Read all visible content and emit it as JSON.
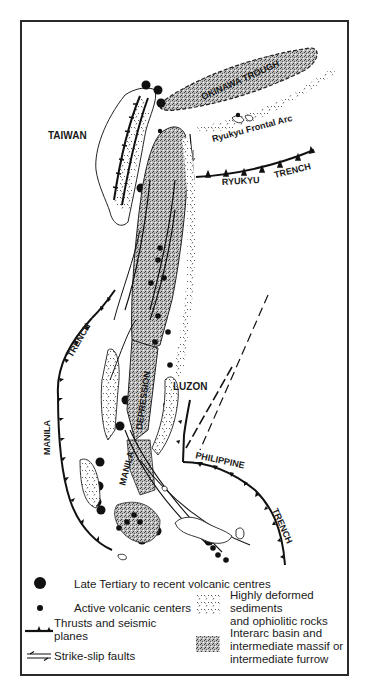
{
  "map": {
    "labels": {
      "okinawa_trough": "OKINAWA TROUGH",
      "ryukyu_frontal_arc": "Ryukyu Frontal Arc",
      "taiwan": "TAIWAN",
      "ryukyu": "RYUKYU",
      "ryukyu_trench": "TRENCH",
      "luzon": "LUZON",
      "depression": "DEPRESSION",
      "manila_basin": "MANILA",
      "manila": "MANILA",
      "manila_trench": "TRENCH",
      "philippine": "PHILIPPINE",
      "philippine_trench": "TRENCH"
    }
  },
  "legend": {
    "items": [
      {
        "symbol": "large-dot",
        "label": "Late Tertiary to recent volcanic centres"
      },
      {
        "symbol": "small-dot",
        "label": "Active volcanic centers"
      },
      {
        "symbol": "thrust-line",
        "label": "Thrusts and seismic planes"
      },
      {
        "symbol": "strike-slip-arrows",
        "label": "Strike-slip faults"
      },
      {
        "symbol": "dashed-pattern",
        "label": "Highly deformed sediments and ophiolitic rocks"
      },
      {
        "symbol": "stipple-pattern",
        "label": "Interarc basin and intermediate massif or intermediate furrow"
      }
    ],
    "lines": {
      "late_tertiary": "Late Tertiary to recent volcanic centres",
      "active": "Active volcanic centers",
      "thrusts_1": "Thrusts and seismic",
      "thrusts_2": "planes",
      "strike_slip": "Strike-slip faults",
      "deformed_1": "Highly deformed sediments",
      "deformed_2": "and ophiolitic rocks",
      "interarc_1": "Interarc basin and",
      "interarc_2": "intermediate massif or",
      "interarc_3": "intermediate furrow"
    }
  }
}
